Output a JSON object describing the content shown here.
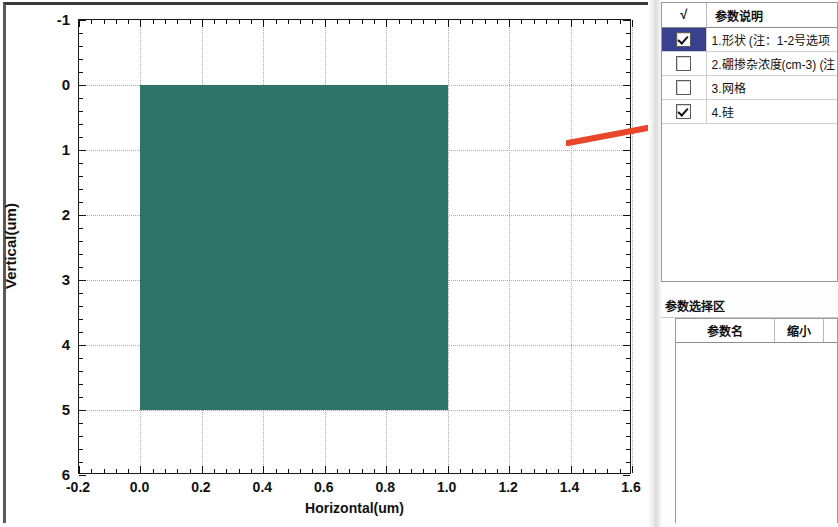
{
  "chart_data": {
    "type": "area",
    "title": "",
    "xlabel": "Horizontal(um)",
    "ylabel": "Vertical(um)",
    "xlim": [
      -0.2,
      1.6
    ],
    "ylim": [
      -1,
      6
    ],
    "y_inverted": true,
    "grid": true,
    "legend": null,
    "x_ticks": [
      "-0.2",
      "0.0",
      "0.2",
      "0.4",
      "0.6",
      "0.8",
      "1.0",
      "1.2",
      "1.4",
      "1.6"
    ],
    "x_tick_values": [
      -0.2,
      0.0,
      0.2,
      0.4,
      0.6,
      0.8,
      1.0,
      1.2,
      1.4,
      1.6
    ],
    "y_ticks": [
      "-1",
      "0",
      "1",
      "2",
      "3",
      "4",
      "5",
      "6"
    ],
    "y_tick_values": [
      -1,
      0,
      1,
      2,
      3,
      4,
      5,
      6
    ],
    "minor_ticks_per_interval": 5,
    "regions": [
      {
        "name": "silicon-region",
        "shape": "rectangle",
        "x_start": 0.0,
        "x_end": 1.0,
        "y_start": 0.0,
        "y_end": 5.0,
        "color": "#2f7468",
        "label": "4.硅"
      }
    ],
    "annotations": [
      {
        "name": "red-arrow",
        "type": "arrow",
        "color": "#e8452a",
        "direction": "right",
        "points_to": "4.硅"
      }
    ]
  },
  "axes": {
    "x_title": "Horizontal(um)",
    "y_title": "Vertical(um)"
  },
  "param_description": {
    "panel_name": "参数说明",
    "header": {
      "check_symbol": "√",
      "name_label": "参数说明"
    },
    "rows": [
      {
        "checked": true,
        "selected": true,
        "label": "1.形状 (注：1-2号选项"
      },
      {
        "checked": false,
        "selected": false,
        "label": "2.硼掺杂浓度(cm-3) (注"
      },
      {
        "checked": false,
        "selected": false,
        "label": "3.网格"
      },
      {
        "checked": true,
        "selected": false,
        "label": "4.硅"
      }
    ]
  },
  "param_select": {
    "title": "参数选择区",
    "columns": [
      "参数名",
      "缩小",
      ""
    ],
    "rows": []
  },
  "colors": {
    "region_fill": "#2f7468",
    "selection_blue": "#39408f",
    "arrow_red": "#e8452a",
    "panel_border": "#9a9a9a"
  }
}
